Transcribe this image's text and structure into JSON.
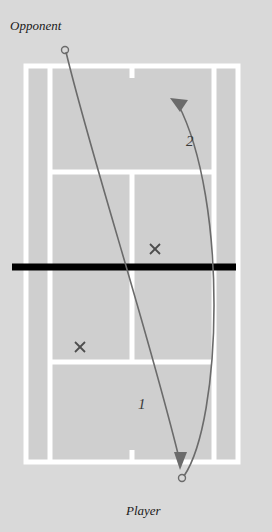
{
  "diagram": {
    "type": "tennis-court-tactics",
    "background_color": "#d9d9d9",
    "court": {
      "surface_color": "#cfcfcf",
      "line_color": "#ffffff",
      "net_color": "#000000"
    },
    "labels": {
      "opponent": "Opponent",
      "player": "Player",
      "shot_one": "1",
      "shot_two": "2"
    },
    "markers": {
      "cross_color": "#4d4d4d",
      "cross_upper": {
        "x": 155,
        "y": 249,
        "glyph": "x"
      },
      "cross_lower": {
        "x": 80,
        "y": 347,
        "glyph": "x"
      }
    },
    "endpoints": {
      "opponent_point": {
        "x": 65,
        "y": 50
      },
      "player_point": {
        "x": 182,
        "y": 478
      }
    },
    "arrows": {
      "arrow_one": {
        "label": "1",
        "from": "opponent",
        "to": "player-side",
        "color": "#6b6b6b"
      },
      "arrow_two": {
        "label": "2",
        "from": "player",
        "to": "opponent-side",
        "color": "#6b6b6b"
      }
    }
  }
}
